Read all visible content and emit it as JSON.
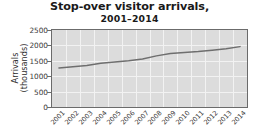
{
  "chart_data": {
    "type": "line",
    "title": "Stop-over visitor arrivals,",
    "subtitle": "2001–2014",
    "xlabel": "",
    "ylabel": "Arrivals",
    "ylabel_line2": "(thousands)",
    "categories": [
      "2001",
      "2002",
      "2003",
      "2004",
      "2005",
      "2006",
      "2007",
      "2008",
      "2009",
      "2010",
      "2011",
      "2012",
      "2013",
      "2014"
    ],
    "values": [
      1270,
      1310,
      1350,
      1420,
      1460,
      1500,
      1560,
      1660,
      1740,
      1770,
      1800,
      1840,
      1890,
      1960
    ],
    "series": [
      {
        "name": "Stop-over visitor arrivals",
        "values": [
          1270,
          1310,
          1350,
          1420,
          1460,
          1500,
          1560,
          1660,
          1740,
          1770,
          1800,
          1840,
          1890,
          1960
        ],
        "color": "#6e6e6e"
      }
    ],
    "ylim": [
      0,
      2500
    ],
    "yticks": [
      2500,
      2000,
      1500,
      1000,
      500,
      0
    ],
    "ytick_labels": [
      "2500",
      "2000",
      "1500",
      "1000",
      "500",
      "0"
    ],
    "grid": true,
    "grid_color": "#f2f2f2",
    "plot_background": "#dcdcdc",
    "frame_color": "#6b6b6b",
    "legend": "none",
    "markers": "none"
  }
}
